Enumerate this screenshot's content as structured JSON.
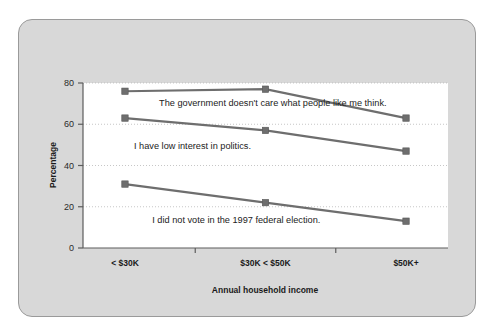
{
  "panel": {
    "background_color": "#d8d8d8",
    "border_color": "#9a9a9a"
  },
  "chart_data": {
    "type": "line",
    "title": "",
    "xlabel": "Annual household income",
    "ylabel": "Percentage",
    "categories": [
      "< $30K",
      "$30K < $50K",
      "$50K+"
    ],
    "ylim": [
      0,
      80
    ],
    "yticks": [
      0,
      20,
      40,
      60,
      80
    ],
    "ytick_labels": [
      "0",
      "20",
      "40",
      "60",
      "80"
    ],
    "grid": "horizontal-dotted",
    "legend_position": "inline-below-each-line",
    "series_color": "#6e6e6e",
    "marker": "square",
    "series": [
      {
        "name": "The government doesn't care what people like me think.",
        "values": [
          76,
          77,
          63
        ]
      },
      {
        "name": "I have low interest in politics.",
        "values": [
          63,
          57,
          47
        ]
      },
      {
        "name": "I did not vote in the 1997 federal election.",
        "values": [
          31,
          22,
          13
        ]
      }
    ],
    "annotations": [
      {
        "text": "The government doesn't care what people like me think.",
        "x": 0.52,
        "y": 69
      },
      {
        "text": "I have low interest in politics.",
        "x": 0.3,
        "y": 48
      },
      {
        "text": "I did not vote in the 1997 federal election.",
        "x": 0.42,
        "y": 12
      }
    ]
  }
}
